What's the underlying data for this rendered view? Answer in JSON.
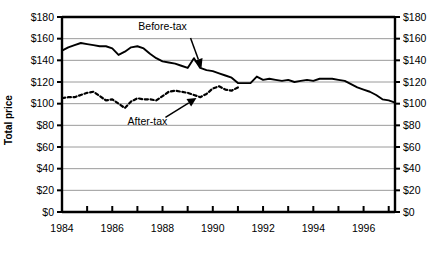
{
  "chart_data": {
    "type": "line",
    "title": "",
    "xlabel": "",
    "ylabel": "Total price",
    "ylim": [
      0,
      180
    ],
    "xlim": [
      1984,
      1997.25
    ],
    "grid": true,
    "legend_position": "none",
    "y_ticks": [
      "$0",
      "$20",
      "$40",
      "$60",
      "$80",
      "$100",
      "$120",
      "$140",
      "$160",
      "$180"
    ],
    "y_tick_values": [
      0,
      20,
      40,
      60,
      80,
      100,
      120,
      140,
      160,
      180
    ],
    "y_axis_duplicated_right": true,
    "x_ticks": [
      "1984",
      "1986",
      "1988",
      "1990",
      "1992",
      "1994",
      "1996"
    ],
    "x_tick_values": [
      1984,
      1986,
      1988,
      1990,
      1992,
      1994,
      1996
    ],
    "x_minor_tick_values": [
      1985,
      1987,
      1989,
      1991,
      1993,
      1995,
      1997
    ],
    "annotations": [
      {
        "text": "Before-tax",
        "series": "Before-tax",
        "x": 1988.0,
        "y": 168
      },
      {
        "text": "After-tax",
        "series": "After-tax",
        "x": 1987.4,
        "y": 80
      }
    ],
    "series": [
      {
        "name": "Before-tax",
        "style": "solid",
        "color": "#000000",
        "x": [
          1984.0,
          1984.25,
          1984.5,
          1984.75,
          1985.0,
          1985.25,
          1985.5,
          1985.75,
          1986.0,
          1986.25,
          1986.5,
          1986.75,
          1987.0,
          1987.25,
          1987.5,
          1987.75,
          1988.0,
          1988.25,
          1988.5,
          1988.75,
          1989.0,
          1989.25,
          1989.5,
          1989.75,
          1990.0,
          1990.25,
          1990.5,
          1990.75,
          1991.0,
          1991.25,
          1991.5,
          1991.75,
          1992.0,
          1992.25,
          1992.5,
          1992.75,
          1993.0,
          1993.25,
          1993.5,
          1993.75,
          1994.0,
          1994.25,
          1994.5,
          1994.75,
          1995.0,
          1995.25,
          1995.5,
          1995.75,
          1996.0,
          1996.25,
          1996.5,
          1996.75,
          1997.0,
          1997.25
        ],
        "values": [
          149,
          152,
          154,
          156,
          155,
          154,
          153,
          153,
          151,
          145,
          148,
          152,
          153,
          151,
          146,
          142,
          139,
          138,
          137,
          135,
          133,
          142,
          133,
          131,
          130,
          128,
          126,
          124,
          119,
          119,
          119,
          125,
          122,
          123,
          122,
          121,
          122,
          120,
          121,
          122,
          121,
          123,
          123,
          123,
          122,
          121,
          118,
          115,
          113,
          111,
          108,
          104,
          103,
          101
        ]
      },
      {
        "name": "After-tax",
        "style": "dashed",
        "color": "#000000",
        "x": [
          1984.0,
          1984.25,
          1984.5,
          1984.75,
          1985.0,
          1985.25,
          1985.5,
          1985.75,
          1986.0,
          1986.25,
          1986.5,
          1986.75,
          1987.0,
          1987.25,
          1987.5,
          1987.75,
          1988.0,
          1988.25,
          1988.5,
          1988.75,
          1989.0,
          1989.25,
          1989.5,
          1989.75,
          1990.0,
          1990.25,
          1990.5,
          1990.75,
          1991.0
        ],
        "values": [
          105,
          106,
          106,
          108,
          110,
          111,
          107,
          103,
          104,
          100,
          96,
          102,
          105,
          104,
          104,
          103,
          107,
          111,
          112,
          111,
          110,
          108,
          106,
          109,
          114,
          116,
          113,
          112,
          115
        ]
      }
    ]
  }
}
